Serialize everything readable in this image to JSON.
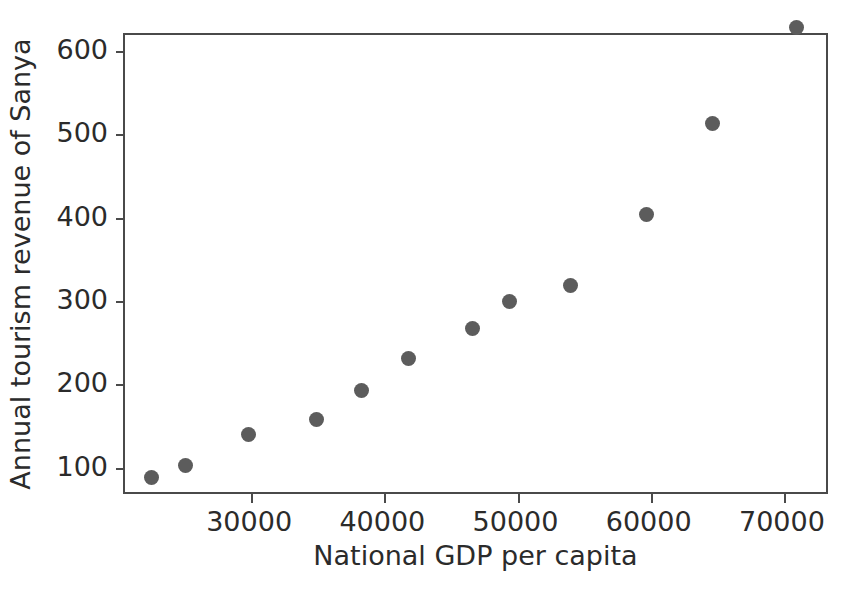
{
  "chart_data": {
    "type": "scatter",
    "title": "",
    "xlabel": "National GDP per capita",
    "ylabel": "Annual tourism revenue of Sanya",
    "xlim": [
      20530,
      73460
    ],
    "ylim": [
      66,
      600
    ],
    "y_axis_top_value": 619,
    "y_axis_bottom_value": 66,
    "grid": false,
    "legend": null,
    "marker_color": "#5c5c5c",
    "frame_color": "#4a4a4a",
    "tick_label_color": "#2b2b2b",
    "xticks": [
      30000,
      40000,
      50000,
      60000,
      70000
    ],
    "xtick_labels": [
      "30000",
      "40000",
      "50000",
      "60000",
      "70000"
    ],
    "yticks": [
      100,
      200,
      300,
      400,
      500,
      600
    ],
    "ytick_labels": [
      "100",
      "200",
      "300",
      "400",
      "500",
      "600"
    ],
    "x": [
      22500,
      25040,
      29770,
      34890,
      38270,
      41800,
      46620,
      49400,
      54000,
      59700,
      64660,
      70970
    ],
    "y": [
      88,
      103,
      140,
      158,
      192,
      231,
      267,
      299,
      318,
      404,
      513,
      628
    ],
    "points": [
      {
        "x": 22500,
        "y": 88
      },
      {
        "x": 25040,
        "y": 103
      },
      {
        "x": 29770,
        "y": 140
      },
      {
        "x": 34890,
        "y": 158
      },
      {
        "x": 38270,
        "y": 192
      },
      {
        "x": 41800,
        "y": 231
      },
      {
        "x": 46620,
        "y": 267
      },
      {
        "x": 49400,
        "y": 299
      },
      {
        "x": 54000,
        "y": 318
      },
      {
        "x": 59700,
        "y": 404
      },
      {
        "x": 64660,
        "y": 513
      },
      {
        "x": 70970,
        "y": 628
      }
    ]
  }
}
